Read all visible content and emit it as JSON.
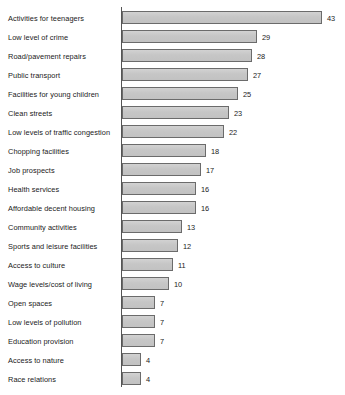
{
  "chart_data": {
    "type": "bar",
    "orientation": "horizontal",
    "title": "",
    "subtitle": "",
    "xlabel": "",
    "ylabel": "",
    "xlim": [
      0,
      43
    ],
    "grid": false,
    "legend": null,
    "axis_line": true,
    "bar_color": "#c9c9c9",
    "bar_border_color": "#6b6b6b",
    "text_color": "#1a1a1a",
    "value_labels": true,
    "categories": [
      "Activities for teenagers",
      "Low level of crime",
      "Road/pavement repairs",
      "Public transport",
      "Facilities for young children",
      "Clean streets",
      "Low levels of traffic congestion",
      "Chopping facilities",
      "Job prospects",
      "Health services",
      "Affordable decent housing",
      "Community activities",
      "Sports and leisure facilities",
      "Access to culture",
      "Wage levels/cost of living",
      "Open spaces",
      "Low levels of pollution",
      "Education provision",
      "Access to nature",
      "Race relations"
    ],
    "values": [
      43,
      29,
      28,
      27,
      25,
      23,
      22,
      18,
      17,
      16,
      16,
      13,
      12,
      11,
      10,
      7,
      7,
      7,
      4,
      4
    ],
    "value_text": [
      "43",
      "29",
      "28",
      "27",
      "25",
      "23",
      "22",
      "18",
      "17",
      "16",
      "16",
      "13",
      "12",
      "11",
      "10",
      "7",
      "7",
      "7",
      "4",
      "4"
    ]
  },
  "footnote": ""
}
